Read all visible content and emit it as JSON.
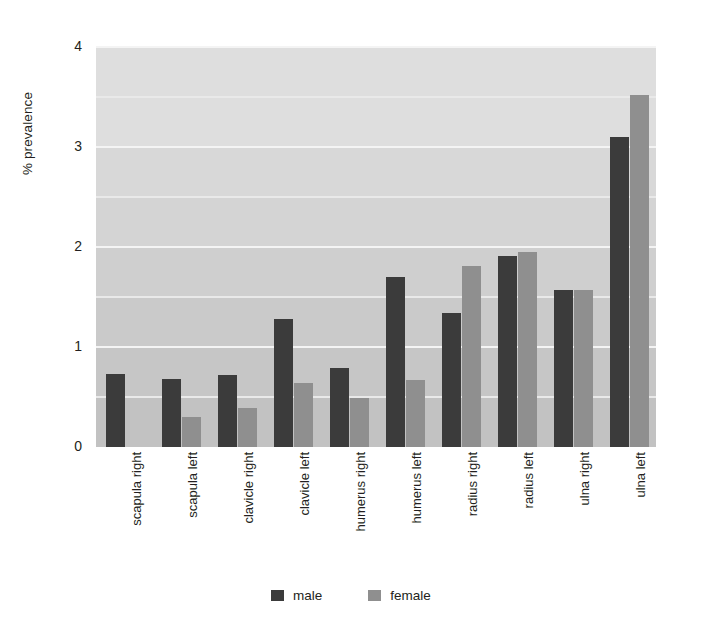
{
  "chart_data": {
    "type": "bar",
    "title": "",
    "xlabel": "",
    "ylabel": "% prevalence",
    "ylim": [
      0,
      4
    ],
    "yticks": [
      0,
      1,
      2,
      3,
      4
    ],
    "ytick_labels": [
      "0",
      "1",
      "2",
      "3",
      "4"
    ],
    "minor_gridlines": [
      0.5,
      1.5,
      2.5,
      3.5
    ],
    "grid": true,
    "legend_position": "bottom",
    "categories": [
      "scapula right",
      "scapula left",
      "clavicle right",
      "clavicle left",
      "humerus right",
      "humerus left",
      "radius right",
      "radius left",
      "ulna right",
      "ulna left"
    ],
    "series": [
      {
        "name": "male",
        "color": "#3b3b3b",
        "values": [
          0.73,
          0.68,
          0.72,
          1.28,
          0.79,
          1.7,
          1.34,
          1.91,
          1.57,
          3.1
        ]
      },
      {
        "name": "female",
        "color": "#8f8f8f",
        "values": [
          0,
          0.3,
          0.39,
          0.64,
          0.49,
          0.67,
          1.81,
          1.95,
          1.57,
          3.52
        ]
      }
    ]
  },
  "legend": {
    "items": [
      {
        "label": "male",
        "swatch": "male"
      },
      {
        "label": "female",
        "swatch": "female"
      }
    ]
  },
  "axes": {
    "y_title": "% prevalence"
  }
}
